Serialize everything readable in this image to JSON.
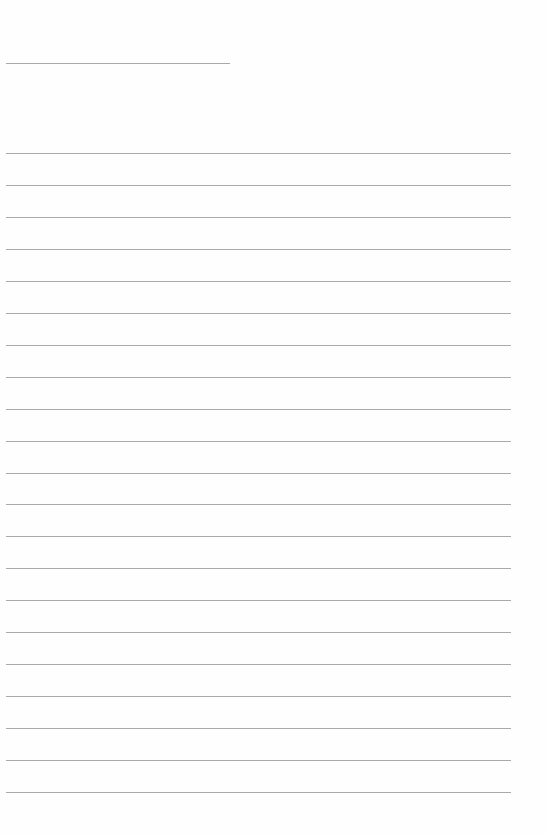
{
  "document": {
    "type": "blank lined page",
    "title_line": {
      "x": 6,
      "y": 63,
      "width": 224
    },
    "ruled_lines": {
      "count": 21,
      "first_y": 153,
      "spacing": 31.95,
      "x": 6,
      "width": 505
    },
    "colors": {
      "background": "#fefefe",
      "rule": "#9a9a9a"
    }
  }
}
